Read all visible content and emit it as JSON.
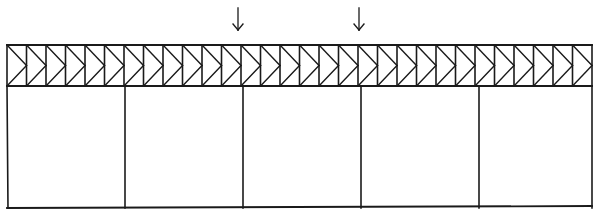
{
  "diagram": {
    "type": "structural-truss-frame",
    "colors": {
      "line": "#1a1a1a",
      "background": "#ffffff"
    },
    "truss": {
      "x_start": 7,
      "x_end": 592,
      "top_chord_y": 45,
      "bottom_chord_y": 86,
      "panel_count": 30,
      "web_pattern": "chevron-pointing-right"
    },
    "frame": {
      "bay_count": 5,
      "column_x": [
        7,
        125,
        243,
        361,
        479,
        592
      ],
      "base_y": 208
    },
    "loads": [
      {
        "label": "",
        "x": 238,
        "y_top": 8,
        "y_bottom": 30,
        "direction": "down"
      },
      {
        "label": "",
        "x": 359,
        "y_top": 8,
        "y_bottom": 30,
        "direction": "down"
      }
    ]
  }
}
